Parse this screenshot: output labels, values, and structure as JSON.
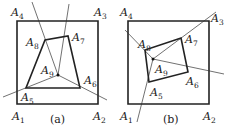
{
  "panels": [
    {
      "caption": "(a)",
      "square": [
        [
          17,
          104
        ],
        [
          98,
          104
        ],
        [
          98,
          21
        ],
        [
          17,
          21
        ]
      ],
      "quad": [
        [
          26,
          88
        ],
        [
          80,
          88
        ],
        [
          68,
          36
        ],
        [
          45,
          40
        ]
      ],
      "center": [
        58,
        75
      ],
      "lines": [
        [
          [
            3,
            97
          ],
          [
            58,
            75
          ]
        ],
        [
          [
            58,
            75
          ],
          [
            107,
            100
          ]
        ],
        [
          [
            58,
            75
          ],
          [
            69,
            4
          ]
        ],
        [
          [
            58,
            75
          ],
          [
            32,
            2
          ]
        ]
      ],
      "labels": [
        {
          "name": "A",
          "sub": "1",
          "x": 12,
          "y": 120
        },
        {
          "name": "A",
          "sub": "2",
          "x": 93,
          "y": 120
        },
        {
          "name": "A",
          "sub": "3",
          "x": 94,
          "y": 16
        },
        {
          "name": "A",
          "sub": "4",
          "x": 11,
          "y": 16
        },
        {
          "name": "A",
          "sub": "5",
          "x": 21,
          "y": 101
        },
        {
          "name": "A",
          "sub": "6",
          "x": 84,
          "y": 84
        },
        {
          "name": "A",
          "sub": "7",
          "x": 72,
          "y": 41
        },
        {
          "name": "A",
          "sub": "8",
          "x": 26,
          "y": 46
        },
        {
          "name": "A",
          "sub": "9",
          "x": 41,
          "y": 74
        }
      ]
    },
    {
      "caption": "(b)",
      "square": [
        [
          128,
          104
        ],
        [
          209,
          104
        ],
        [
          209,
          21
        ],
        [
          128,
          21
        ]
      ],
      "quad": [
        [
          149,
          82
        ],
        [
          188,
          72
        ],
        [
          181,
          38
        ],
        [
          145,
          50
        ]
      ],
      "center": [
        153,
        59
      ],
      "lines": [
        [
          [
            125,
            30
          ],
          [
            153,
            59
          ]
        ],
        [
          [
            153,
            59
          ],
          [
            224,
            74
          ]
        ],
        [
          [
            153,
            59
          ],
          [
            216,
            12
          ]
        ],
        [
          [
            153,
            59
          ],
          [
            137,
            122
          ]
        ]
      ],
      "labels": [
        {
          "name": "A",
          "sub": "1",
          "x": 120,
          "y": 120
        },
        {
          "name": "A",
          "sub": "2",
          "x": 203,
          "y": 120
        },
        {
          "name": "A",
          "sub": "3",
          "x": 211,
          "y": 22
        },
        {
          "name": "A",
          "sub": "4",
          "x": 120,
          "y": 16
        },
        {
          "name": "A",
          "sub": "5",
          "x": 150,
          "y": 96
        },
        {
          "name": "A",
          "sub": "6",
          "x": 186,
          "y": 85
        },
        {
          "name": "A",
          "sub": "7",
          "x": 185,
          "y": 43
        },
        {
          "name": "A",
          "sub": "8",
          "x": 138,
          "y": 48
        },
        {
          "name": "A",
          "sub": "9",
          "x": 155,
          "y": 73
        }
      ]
    }
  ],
  "captions_pos": [
    {
      "x": 50,
      "y": 123
    },
    {
      "x": 163,
      "y": 123
    }
  ]
}
